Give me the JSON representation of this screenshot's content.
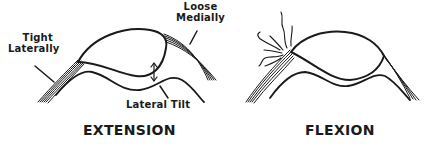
{
  "diagram": {
    "panels": [
      {
        "caption": "EXTENSION",
        "labels": {
          "tight": "Tight\nLaterally",
          "tight_line1": "Tight",
          "tight_line2": "Laterally",
          "loose_line1": "Loose",
          "loose_line2": "Medially",
          "tilt": "Lateral Tilt"
        }
      },
      {
        "caption": "FLEXION",
        "labels": {}
      }
    ],
    "stroke_color": "#1a1a1a",
    "background": "#ffffff"
  }
}
